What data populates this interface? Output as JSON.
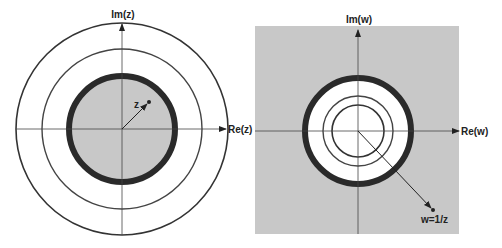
{
  "colors": {
    "background": "#ffffff",
    "shade": "#c8c8c8",
    "stroke": "#333333",
    "thick_stroke": "#2a2a2a",
    "axis": "#444444"
  },
  "left_plane": {
    "title": "z-plane",
    "im_label": "Im(z)",
    "re_label": "Re(z)",
    "point_label": "z",
    "origin": [
      122,
      129
    ],
    "circles": [
      {
        "role": "unit-circle-thick",
        "r": 53,
        "filled": true
      },
      {
        "role": "middle-circle",
        "r": 80
      },
      {
        "role": "outer-circle",
        "r": 106
      }
    ],
    "point": [
      149,
      102
    ]
  },
  "right_plane": {
    "title": "w-plane",
    "im_label": "Im(w)",
    "re_label": "Re(w)",
    "point_label": "w=1/z",
    "origin": [
      358,
      131
    ],
    "background_square": {
      "x": 255,
      "y": 26,
      "w": 204,
      "h": 208
    },
    "circles": [
      {
        "role": "unit-circle-thick",
        "r": 53,
        "filled_white": true
      },
      {
        "role": "image-of-middle-circle",
        "r": 35
      },
      {
        "role": "image-of-outer-circle",
        "r": 26
      }
    ],
    "point": [
      433,
      210
    ]
  }
}
